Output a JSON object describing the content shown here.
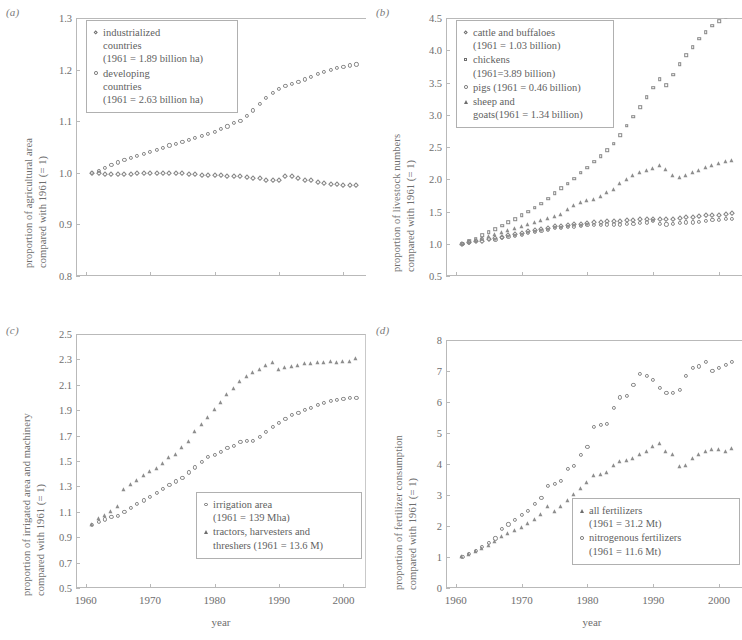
{
  "figure": {
    "xlabel": "year",
    "xticks": [
      "1960",
      "1970",
      "1980",
      "1990",
      "2000"
    ],
    "xlim": [
      1958.5,
      2003.5
    ]
  },
  "panels": [
    {
      "key": "a",
      "label": "(a)",
      "ylabel_line1": "proportion of agricultural area",
      "ylabel_line2": "compared with 1961 (= 1)",
      "yticks": [
        "0.8",
        "0.9",
        "1.0",
        "1.1",
        "1.2",
        "1.3"
      ],
      "legend": [
        {
          "marker": "diamond",
          "text": "industrialized\ncountries\n(1961 = 1.89 billion ha)"
        },
        {
          "marker": "circle",
          "text": "developing\ncountries\n(1961 = 2.63 billion ha)"
        }
      ]
    },
    {
      "key": "b",
      "label": "(b)",
      "ylabel_line1": "proportion of livestock numbers",
      "ylabel_line2": "compared with 1961 (= 1)",
      "yticks": [
        "0.5",
        "1.0",
        "1.5",
        "2.0",
        "2.5",
        "3.0",
        "3.5",
        "4.0",
        "4.5"
      ],
      "legend": [
        {
          "marker": "diamond",
          "text": "cattle and buffaloes\n(1961 = 1.03 billion)"
        },
        {
          "marker": "square",
          "text": "chickens\n(1961=3.89 billion)"
        },
        {
          "marker": "circle",
          "text": "pigs (1961 = 0.46 billion)"
        },
        {
          "marker": "triangle",
          "text": "sheep and\ngoats(1961 = 1.34 billion)"
        }
      ]
    },
    {
      "key": "c",
      "label": "(c)",
      "ylabel_line1": "proportion of irrigated area and machinery",
      "ylabel_line2": "compared with 1961 (= 1)",
      "yticks": [
        "0.5",
        "0.7",
        "0.9",
        "1.1",
        "1.3",
        "1.5",
        "1.7",
        "1.9",
        "2.1",
        "2.3",
        "2.5"
      ],
      "legend": [
        {
          "marker": "circle",
          "text": "irrigation area\n(1961 = 139 Mha)"
        },
        {
          "marker": "triangle",
          "text": "tractors, harvesters and\nthreshers (1961 = 13.6 M)"
        }
      ]
    },
    {
      "key": "d",
      "label": "(d)",
      "ylabel_line1": "proportion of fertilizer consumption",
      "ylabel_line2": "compared with 1961 (= 1)",
      "yticks": [
        "0",
        "1",
        "2",
        "3",
        "4",
        "5",
        "6",
        "7",
        "8"
      ],
      "legend": [
        {
          "marker": "triangle",
          "text": "all fertilizers\n(1961 = 31.2 Mt)"
        },
        {
          "marker": "circle",
          "text": "nitrogenous fertilizers\n(1961 = 11.6 Mt)"
        }
      ]
    }
  ],
  "chart_data": [
    {
      "type": "scatter",
      "panel": "a",
      "title": "",
      "xlabel": "year",
      "ylabel": "proportion of agricultural area compared with 1961 (= 1)",
      "xlim": [
        1958.5,
        2003.5
      ],
      "ylim": [
        0.8,
        1.3
      ],
      "grid": false,
      "legend_position": "top-left",
      "x": [
        1961,
        1962,
        1963,
        1964,
        1965,
        1966,
        1967,
        1968,
        1969,
        1970,
        1971,
        1972,
        1973,
        1974,
        1975,
        1976,
        1977,
        1978,
        1979,
        1980,
        1981,
        1982,
        1983,
        1984,
        1985,
        1986,
        1987,
        1988,
        1989,
        1990,
        1991,
        1992,
        1993,
        1994,
        1995,
        1996,
        1997,
        1998,
        1999,
        2000,
        2001,
        2002
      ],
      "series": [
        {
          "name": "industrialized countries (1961 = 1.89 billion ha)",
          "marker": "diamond",
          "values": [
            1.0,
            0.999,
            0.998,
            0.997,
            0.998,
            0.998,
            0.998,
            0.999,
            0.999,
            0.999,
            0.999,
            0.999,
            1.0,
            1.0,
            1.0,
            0.998,
            0.997,
            0.996,
            0.996,
            0.995,
            0.995,
            0.994,
            0.993,
            0.993,
            0.992,
            0.99,
            0.989,
            0.987,
            0.986,
            0.986,
            0.994,
            0.994,
            0.99,
            0.987,
            0.986,
            0.983,
            0.98,
            0.979,
            0.978,
            0.977,
            0.976,
            0.976
          ]
        },
        {
          "name": "developing countries (1961 = 2.63 billion ha)",
          "marker": "circle",
          "values": [
            1.0,
            1.004,
            1.01,
            1.015,
            1.02,
            1.025,
            1.029,
            1.033,
            1.037,
            1.041,
            1.045,
            1.049,
            1.053,
            1.056,
            1.06,
            1.063,
            1.067,
            1.071,
            1.075,
            1.08,
            1.085,
            1.09,
            1.096,
            1.101,
            1.11,
            1.121,
            1.133,
            1.145,
            1.155,
            1.163,
            1.168,
            1.172,
            1.176,
            1.181,
            1.186,
            1.191,
            1.196,
            1.2,
            1.203,
            1.206,
            1.208,
            1.21
          ]
        }
      ]
    },
    {
      "type": "scatter",
      "panel": "b",
      "title": "",
      "xlabel": "year",
      "ylabel": "proportion of livestock numbers compared with 1961 (= 1)",
      "xlim": [
        1958.5,
        2003.5
      ],
      "ylim": [
        0.5,
        4.5
      ],
      "grid": false,
      "legend_position": "top-left",
      "x": [
        1961,
        1962,
        1963,
        1964,
        1965,
        1966,
        1967,
        1968,
        1969,
        1970,
        1971,
        1972,
        1973,
        1974,
        1975,
        1976,
        1977,
        1978,
        1979,
        1980,
        1981,
        1982,
        1983,
        1984,
        1985,
        1986,
        1987,
        1988,
        1989,
        1990,
        1991,
        1992,
        1993,
        1994,
        1995,
        1996,
        1997,
        1998,
        1999,
        2000,
        2001,
        2002
      ],
      "series": [
        {
          "name": "cattle and buffaloes (1961 = 1.03 billion)",
          "marker": "diamond",
          "values": [
            1.0,
            1.02,
            1.04,
            1.05,
            1.07,
            1.09,
            1.11,
            1.13,
            1.15,
            1.17,
            1.19,
            1.21,
            1.23,
            1.25,
            1.27,
            1.28,
            1.29,
            1.3,
            1.31,
            1.32,
            1.33,
            1.34,
            1.35,
            1.36,
            1.36,
            1.37,
            1.37,
            1.38,
            1.38,
            1.39,
            1.39,
            1.38,
            1.39,
            1.4,
            1.41,
            1.42,
            1.43,
            1.44,
            1.44,
            1.45,
            1.46,
            1.47
          ]
        },
        {
          "name": "chickens (1961 = 3.89 billion)",
          "marker": "square",
          "values": [
            1.0,
            1.04,
            1.08,
            1.13,
            1.18,
            1.23,
            1.28,
            1.33,
            1.38,
            1.44,
            1.5,
            1.56,
            1.62,
            1.7,
            1.78,
            1.86,
            1.93,
            2.01,
            2.1,
            2.18,
            2.27,
            2.36,
            2.45,
            2.55,
            2.68,
            2.83,
            2.97,
            3.12,
            3.27,
            3.42,
            3.55,
            3.46,
            3.62,
            3.78,
            3.92,
            4.05,
            4.18,
            4.28,
            4.38,
            4.45,
            4.52,
            4.58
          ]
        },
        {
          "name": "pigs (1961 = 0.46 billion)",
          "marker": "circle",
          "values": [
            1.0,
            1.02,
            1.05,
            1.07,
            1.08,
            1.06,
            1.09,
            1.11,
            1.12,
            1.14,
            1.17,
            1.18,
            1.2,
            1.22,
            1.24,
            1.25,
            1.26,
            1.27,
            1.28,
            1.29,
            1.29,
            1.29,
            1.3,
            1.3,
            1.3,
            1.31,
            1.31,
            1.32,
            1.33,
            1.36,
            1.31,
            1.3,
            1.31,
            1.32,
            1.33,
            1.33,
            1.34,
            1.36,
            1.37,
            1.37,
            1.38,
            1.39
          ]
        },
        {
          "name": "sheep and goats (1961 = 1.34 billion)",
          "marker": "triangle",
          "values": [
            1.0,
            1.02,
            1.05,
            1.07,
            1.1,
            1.13,
            1.17,
            1.2,
            1.23,
            1.26,
            1.29,
            1.32,
            1.35,
            1.38,
            1.41,
            1.45,
            1.52,
            1.58,
            1.63,
            1.66,
            1.68,
            1.72,
            1.78,
            1.84,
            1.92,
            1.99,
            2.05,
            2.1,
            2.13,
            2.16,
            2.2,
            2.15,
            2.05,
            2.02,
            2.05,
            2.09,
            2.13,
            2.17,
            2.2,
            2.23,
            2.26,
            2.29
          ]
        }
      ]
    },
    {
      "type": "scatter",
      "panel": "c",
      "title": "",
      "xlabel": "year",
      "ylabel": "proportion of irrigated area and machinery compared with 1961 (= 1)",
      "xlim": [
        1958.5,
        2003.5
      ],
      "ylim": [
        0.5,
        2.5
      ],
      "grid": false,
      "legend_position": "bottom-right",
      "x": [
        1961,
        1962,
        1963,
        1964,
        1965,
        1966,
        1967,
        1968,
        1969,
        1970,
        1971,
        1972,
        1973,
        1974,
        1975,
        1976,
        1977,
        1978,
        1979,
        1980,
        1981,
        1982,
        1983,
        1984,
        1985,
        1986,
        1987,
        1988,
        1989,
        1990,
        1991,
        1992,
        1993,
        1994,
        1995,
        1996,
        1997,
        1998,
        1999,
        2000,
        2001,
        2002
      ],
      "series": [
        {
          "name": "irrigation area (1961 = 139 Mha)",
          "marker": "circle",
          "values": [
            1.0,
            1.02,
            1.04,
            1.06,
            1.07,
            1.1,
            1.13,
            1.16,
            1.19,
            1.22,
            1.25,
            1.28,
            1.31,
            1.34,
            1.37,
            1.41,
            1.45,
            1.49,
            1.53,
            1.55,
            1.57,
            1.6,
            1.62,
            1.65,
            1.66,
            1.66,
            1.69,
            1.73,
            1.77,
            1.8,
            1.83,
            1.86,
            1.88,
            1.9,
            1.92,
            1.94,
            1.96,
            1.97,
            1.98,
            1.99,
            2.0,
            2.0
          ]
        },
        {
          "name": "tractors, harvesters and threshers (1961 = 13.6 M)",
          "marker": "triangle",
          "values": [
            1.0,
            1.04,
            1.07,
            1.1,
            1.14,
            1.27,
            1.31,
            1.34,
            1.38,
            1.41,
            1.44,
            1.48,
            1.52,
            1.55,
            1.6,
            1.65,
            1.73,
            1.78,
            1.84,
            1.9,
            1.96,
            2.02,
            2.07,
            2.12,
            2.16,
            2.19,
            2.22,
            2.25,
            2.27,
            2.22,
            2.23,
            2.24,
            2.25,
            2.26,
            2.26,
            2.27,
            2.27,
            2.28,
            2.27,
            2.28,
            2.28,
            2.3
          ]
        }
      ]
    },
    {
      "type": "scatter",
      "panel": "d",
      "title": "",
      "xlabel": "year",
      "ylabel": "proportion of fertilizer consumption compared with 1961 (= 1)",
      "xlim": [
        1958.5,
        2003.5
      ],
      "ylim": [
        0,
        8
      ],
      "grid": false,
      "legend_position": "bottom-right",
      "x": [
        1961,
        1962,
        1963,
        1964,
        1965,
        1966,
        1967,
        1968,
        1969,
        1970,
        1971,
        1972,
        1973,
        1974,
        1975,
        1976,
        1977,
        1978,
        1979,
        1980,
        1981,
        1982,
        1983,
        1984,
        1985,
        1986,
        1987,
        1988,
        1989,
        1990,
        1991,
        1992,
        1993,
        1994,
        1995,
        1996,
        1997,
        1998,
        1999,
        2000,
        2001,
        2002
      ],
      "series": [
        {
          "name": "all fertilizers (1961 = 31.2 Mt)",
          "marker": "triangle",
          "values": [
            1.0,
            1.07,
            1.15,
            1.25,
            1.35,
            1.5,
            1.63,
            1.75,
            1.85,
            1.95,
            2.08,
            2.2,
            2.35,
            2.6,
            2.45,
            2.6,
            2.8,
            3.0,
            3.2,
            3.4,
            3.6,
            3.65,
            3.7,
            3.95,
            4.05,
            4.1,
            4.15,
            4.3,
            4.4,
            4.55,
            4.65,
            4.4,
            4.3,
            3.9,
            3.95,
            4.15,
            4.3,
            4.4,
            4.45,
            4.45,
            4.4,
            4.5
          ]
        },
        {
          "name": "nitrogenous fertilizers (1961 = 11.6 Mt)",
          "marker": "circle",
          "values": [
            1.0,
            1.1,
            1.2,
            1.32,
            1.45,
            1.6,
            1.9,
            2.05,
            2.2,
            2.35,
            2.5,
            2.7,
            2.9,
            3.3,
            3.35,
            3.45,
            3.85,
            3.95,
            4.3,
            4.55,
            5.2,
            5.25,
            5.3,
            5.8,
            6.15,
            6.2,
            6.55,
            6.9,
            6.85,
            6.7,
            6.45,
            6.3,
            6.3,
            6.4,
            6.85,
            7.1,
            7.15,
            7.3,
            7.0,
            7.1,
            7.2,
            7.3
          ]
        }
      ]
    }
  ]
}
